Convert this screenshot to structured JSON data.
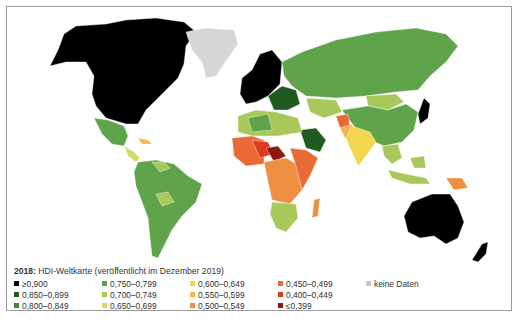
{
  "legend": {
    "title_year": "2018:",
    "title_text": " HDI-Weltkarte (veröffentlicht im Dezember 2019)",
    "items": [
      {
        "label": "≥0,900",
        "color": "#000000"
      },
      {
        "label": "0,850–0,899",
        "color": "#1f5a1f"
      },
      {
        "label": "0,800–0,849",
        "color": "#3f8a3a"
      },
      {
        "label": "0,750–0,799",
        "color": "#5fa34b"
      },
      {
        "label": "0,700–0,749",
        "color": "#a9c85a"
      },
      {
        "label": "0,650–0,699",
        "color": "#d3dc6a"
      },
      {
        "label": "0,600–0,649",
        "color": "#f2d64e"
      },
      {
        "label": "0,550–0,599",
        "color": "#f4b555"
      },
      {
        "label": "0,500–0,549",
        "color": "#ef8f42"
      },
      {
        "label": "0,450–0,499",
        "color": "#ea6a36"
      },
      {
        "label": "0,400–0,449",
        "color": "#dc3b1e"
      },
      {
        "label": "≤0,399",
        "color": "#8a1a0e"
      },
      {
        "label": "keine Daten",
        "color": "#c8c8c8"
      }
    ]
  },
  "map": {
    "regions": {
      "north_america": "#000000",
      "greenland": "#d6d6d6",
      "mexico": "#5fa34b",
      "central_america": "#d3dc6a",
      "caribbean": "#f4b555",
      "south_america": "#5fa34b",
      "venezuela_bolivia": "#a9c85a",
      "europe_west": "#000000",
      "europe_east": "#1f5a1f",
      "russia": "#5fa34b",
      "central_asia": "#a9c85a",
      "mongolia": "#a9c85a",
      "china": "#5fa34b",
      "india": "#f2d64e",
      "pakistan": "#f4b555",
      "afghanistan": "#ea6a36",
      "saudi_arabia": "#1f5a1f",
      "north_africa": "#a9c85a",
      "libya": "#5fa34b",
      "west_africa": "#ea6a36",
      "sahel": "#dc3b1e",
      "niger_chad": "#8a1a0e",
      "central_africa": "#ef8f42",
      "east_africa": "#ea6a36",
      "southern_africa": "#a9c85a",
      "madagascar": "#ef8f42",
      "japan": "#000000",
      "southeast_asia": "#a9c85a",
      "indonesia": "#a9c85a",
      "papua": "#ef8f42",
      "australia": "#000000",
      "new_zealand": "#000000"
    }
  }
}
